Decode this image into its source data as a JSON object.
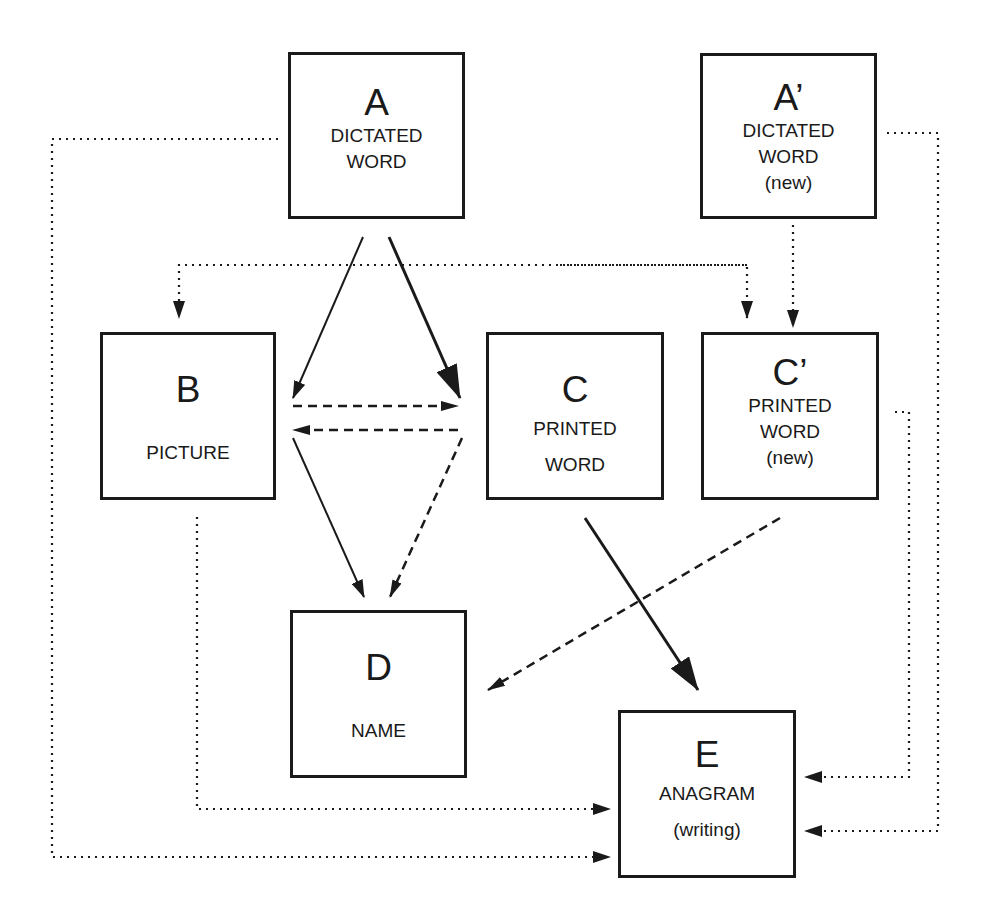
{
  "nodes": {
    "A": {
      "letter": "A",
      "lines": [
        "DICTATED",
        "WORD"
      ]
    },
    "A2": {
      "letter": "A’",
      "lines": [
        "DICTATED",
        "WORD",
        "(new)"
      ]
    },
    "B": {
      "letter": "B",
      "lines": [
        "PICTURE"
      ]
    },
    "C": {
      "letter": "C",
      "lines": [
        "PRINTED",
        "WORD"
      ]
    },
    "C2": {
      "letter": "C’",
      "lines": [
        "PRINTED",
        "WORD",
        "(new)"
      ]
    },
    "D": {
      "letter": "D",
      "lines": [
        "NAME"
      ]
    },
    "E": {
      "letter": "E",
      "lines": [
        "ANAGRAM",
        "(writing)"
      ]
    }
  },
  "edges": [
    {
      "from": "A",
      "to": "B",
      "style": "solid"
    },
    {
      "from": "A",
      "to": "C",
      "style": "solid-thick"
    },
    {
      "from": "A",
      "to": "B",
      "style": "dotted"
    },
    {
      "from": "A",
      "to": "C2",
      "style": "dotted"
    },
    {
      "from": "A",
      "to": "E",
      "style": "dotted"
    },
    {
      "from": "A2",
      "to": "C2",
      "style": "dotted"
    },
    {
      "from": "A2",
      "to": "E",
      "style": "dotted"
    },
    {
      "from": "B",
      "to": "C",
      "style": "dashed"
    },
    {
      "from": "C",
      "to": "B",
      "style": "dashed"
    },
    {
      "from": "B",
      "to": "D",
      "style": "solid"
    },
    {
      "from": "C",
      "to": "D",
      "style": "dashed"
    },
    {
      "from": "C",
      "to": "E",
      "style": "solid-thick"
    },
    {
      "from": "C2",
      "to": "D",
      "style": "dashed"
    },
    {
      "from": "C2",
      "to": "E",
      "style": "dotted"
    },
    {
      "from": "B",
      "to": "E",
      "style": "dotted"
    }
  ],
  "colors": {
    "ink": "#1a1a1a",
    "background": "#ffffff"
  }
}
